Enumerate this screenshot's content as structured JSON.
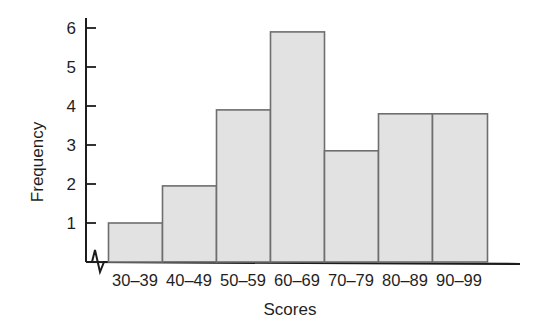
{
  "chart_data": {
    "type": "bar",
    "title": "",
    "subtitle": "",
    "xlabel": "Scores",
    "ylabel": "Frequency",
    "categories": [
      "30–39",
      "40–49",
      "50–59",
      "60–69",
      "70–79",
      "80–89",
      "90–99"
    ],
    "values": [
      1,
      1.95,
      3.9,
      5.9,
      2.85,
      3.8,
      3.8
    ],
    "ytick_labels": [
      "1",
      "2",
      "3",
      "4",
      "5",
      "6"
    ],
    "yticks": [
      1,
      2,
      3,
      4,
      5,
      6
    ],
    "ylim": [
      0,
      6.25
    ],
    "xlim": [
      0,
      7
    ],
    "grid": false,
    "legend": null,
    "legend_position": "none",
    "axis_break": true,
    "annotations": [],
    "style": {
      "bar_fill": "#e2e2e2",
      "bar_edge": "#6e6e6e",
      "axis_color": "#1c1c1c",
      "background": "#ffffff"
    }
  },
  "figure": {
    "ylabel": "Frequency",
    "xlabel": "Scores"
  }
}
